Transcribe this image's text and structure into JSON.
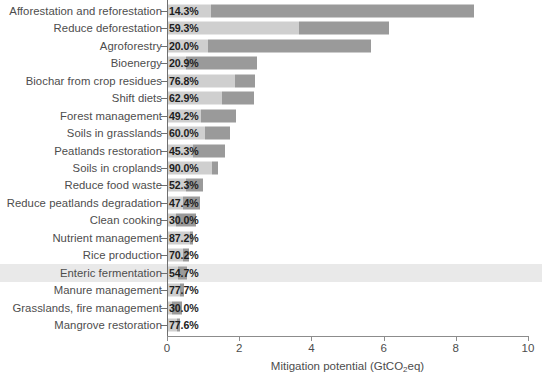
{
  "chart_data": {
    "type": "bar",
    "orientation": "horizontal",
    "title": "",
    "xlabel": "Mitigation potential (GtCO2eq)",
    "xlabel_parts": {
      "pre": "Mitigation potential (GtCO",
      "sub": "2",
      "post": "eq)"
    },
    "ylabel": "",
    "xlim": [
      0,
      10
    ],
    "xticks": [
      0,
      2,
      4,
      6,
      8,
      10
    ],
    "xticklabels": [
      "0",
      "2",
      "4",
      "6",
      "8",
      "10"
    ],
    "grid": false,
    "legend": false,
    "stacked": true,
    "series": [
      {
        "name": "technical-share",
        "color": "#cfcfcf"
      },
      {
        "name": "remaining-potential",
        "color": "#9a9a9a"
      }
    ],
    "categories": [
      "Afforestation and reforestation",
      "Reduce deforestation",
      "Agroforestry",
      "Bioenergy",
      "Biochar from crop residues",
      "Shift diets",
      "Forest management",
      "Soils in grasslands",
      "Peatlands restoration",
      "Soils in croplands",
      "Reduce food waste",
      "Reduce peatlands degradation",
      "Clean cooking",
      "Nutrient management",
      "Rice production",
      "Enteric fermentation",
      "Manure management",
      "Grasslands, fire management",
      "Mangrove restoration"
    ],
    "percent_labels": [
      "14.3%",
      "59.3%",
      "20.0%",
      "20.9%",
      "76.8%",
      "62.9%",
      "49.2%",
      "60.0%",
      "45.3%",
      "90.0%",
      "52.3%",
      "47.4%",
      "30.0%",
      "87.2%",
      "70.2%",
      "54.7%",
      "77.7%",
      "30.0%",
      "77.6%"
    ],
    "percent_values": [
      14.3,
      59.3,
      20.0,
      20.9,
      76.8,
      62.9,
      49.2,
      60.0,
      45.3,
      90.0,
      52.3,
      47.4,
      30.0,
      87.2,
      70.2,
      54.7,
      77.7,
      30.0,
      77.6
    ],
    "totals": [
      8.5,
      6.15,
      5.65,
      2.5,
      2.45,
      2.4,
      1.9,
      1.75,
      1.6,
      1.4,
      1.0,
      0.92,
      0.8,
      0.72,
      0.62,
      0.55,
      0.48,
      0.42,
      0.35
    ],
    "light_segment": [
      1.22,
      3.65,
      1.13,
      0.52,
      1.88,
      1.51,
      0.93,
      1.05,
      0.72,
      1.26,
      0.52,
      0.44,
      0.24,
      0.63,
      0.44,
      0.3,
      0.37,
      0.13,
      0.27
    ],
    "dark_segment": [
      7.28,
      2.5,
      4.52,
      1.98,
      0.57,
      0.89,
      0.97,
      0.7,
      0.88,
      0.14,
      0.48,
      0.48,
      0.56,
      0.09,
      0.18,
      0.25,
      0.11,
      0.29,
      0.08
    ],
    "highlighted_category": "Enteric fermentation",
    "highlight_color": "#e9e9e9"
  },
  "caption": {
    "cut_off_text": ""
  }
}
